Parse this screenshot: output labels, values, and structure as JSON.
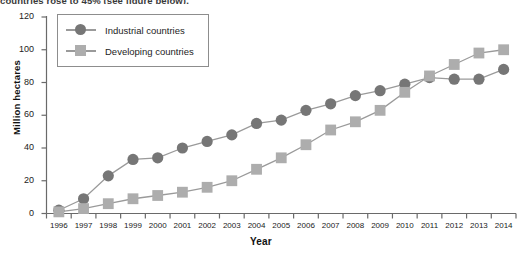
{
  "caption_fragment": "countries rose to 45% (see figure below).",
  "chart_data": {
    "type": "line",
    "title": "",
    "xlabel": "Year",
    "ylabel": "Million hectares",
    "x": [
      1996,
      1997,
      1998,
      1999,
      2000,
      2001,
      2002,
      2003,
      2004,
      2005,
      2006,
      2007,
      2008,
      2009,
      2010,
      2011,
      2012,
      2013,
      2014
    ],
    "categories": [
      "1996",
      "1997",
      "1998",
      "1999",
      "2000",
      "2001",
      "2002",
      "2003",
      "2004",
      "2005",
      "2006",
      "2007",
      "2008",
      "2009",
      "2010",
      "2011",
      "2012",
      "2013",
      "2014"
    ],
    "series": [
      {
        "name": "Industrial countries",
        "marker": "circle",
        "color": "#767676",
        "values": [
          2,
          9,
          23,
          33,
          34,
          40,
          44,
          48,
          55,
          57,
          63,
          67,
          72,
          75,
          79,
          83,
          82,
          82,
          88
        ]
      },
      {
        "name": "Developing countries",
        "marker": "square",
        "color": "#adadad",
        "values": [
          1,
          3,
          6,
          9,
          11,
          13,
          16,
          20,
          27,
          34,
          42,
          51,
          56,
          63,
          74,
          84,
          91,
          98,
          100
        ]
      }
    ],
    "ylim": [
      0,
      120
    ],
    "yticks": [
      0,
      20,
      40,
      60,
      80,
      100,
      120
    ],
    "ytick_labels": [
      "0",
      "20",
      "40",
      "60",
      "80",
      "100",
      "120"
    ],
    "grid": false,
    "legend_position": "top-left",
    "legend_entries": [
      "Industrial countries",
      "Developing countries"
    ],
    "axis_color": "#6a6a6a",
    "line_color": "#9a9a9a"
  }
}
